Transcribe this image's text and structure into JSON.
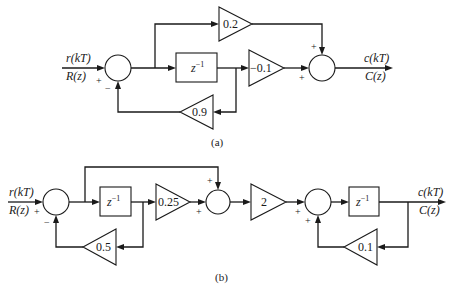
{
  "diagram_a": {
    "caption": "(a)",
    "input_time": "r(kT)",
    "input_z": "R(z)",
    "output_time": "c(kT)",
    "output_z": "C(z)",
    "delay_label": "z",
    "delay_exp": "−1",
    "gains": {
      "feedforward": "0.2",
      "forward": "−0.1",
      "feedback": "0.9"
    },
    "signs": {
      "sum1_input": "+",
      "sum1_feedback": "−",
      "sum2_top": "+",
      "sum2_left": "+"
    }
  },
  "diagram_b": {
    "caption": "(b)",
    "input_time": "r(kT)",
    "input_z": "R(z)",
    "output_time": "c(kT)",
    "output_z": "C(z)",
    "delay1_label": "z",
    "delay1_exp": "−1",
    "delay2_label": "z",
    "delay2_exp": "−1",
    "gains": {
      "stage1_forward": "0.25",
      "stage1_feedback": "0.5",
      "middle": "2",
      "stage2_feedback": "0.1"
    },
    "signs": {
      "sum1_input": "+",
      "sum1_feedback": "−",
      "sum2_top": "+",
      "sum2_left": "+",
      "sum3_left": "+",
      "sum3_bottom": "+"
    }
  }
}
